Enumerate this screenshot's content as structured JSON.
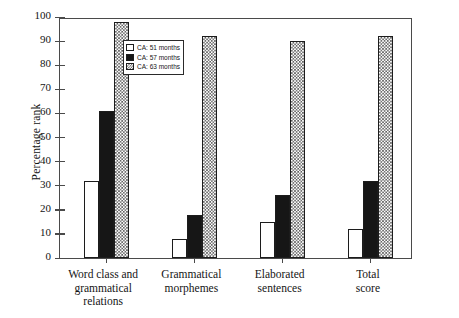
{
  "chart_data": {
    "type": "bar",
    "title": "",
    "xlabel": "",
    "ylabel": "Percentage rank",
    "ylim": [
      0,
      100
    ],
    "yticks": [
      0,
      10,
      20,
      30,
      40,
      50,
      60,
      70,
      80,
      90,
      100
    ],
    "grid": false,
    "legend_position": "top-left inside plot",
    "categories": [
      "Word class and grammatical relations",
      "Grammatical morphemes",
      "Elaborated sentences",
      "Total score"
    ],
    "category_lines": [
      [
        "Word class and",
        "grammatical",
        "relations"
      ],
      [
        "Grammatical",
        "morphemes"
      ],
      [
        "Elaborated",
        "sentences"
      ],
      [
        "Total",
        "score"
      ]
    ],
    "series": [
      {
        "name": "CA: 51 months",
        "fill": "white",
        "values": [
          32,
          8,
          15,
          12
        ]
      },
      {
        "name": "CA: 57 months",
        "fill": "black",
        "values": [
          61,
          18,
          26,
          32
        ]
      },
      {
        "name": "CA: 63 months",
        "fill": "checkered-grey",
        "values": [
          98,
          92,
          90,
          92
        ]
      }
    ]
  },
  "legend": {
    "entries": [
      {
        "label": "CA: 51 months"
      },
      {
        "label": "CA: 57 months"
      },
      {
        "label": "CA: 63 months"
      }
    ]
  }
}
